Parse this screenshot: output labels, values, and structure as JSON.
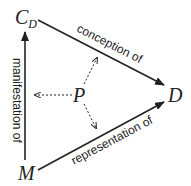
{
  "nodes": {
    "cd": {
      "label": "C",
      "subscript": "D"
    },
    "d": {
      "label": "D"
    },
    "m": {
      "label": "M"
    },
    "p": {
      "label": "P"
    }
  },
  "edges": {
    "cd_to_d": "conception of",
    "m_to_d": "representation of",
    "m_to_cd": "manifestation of"
  },
  "colors": {
    "line": "#222222"
  }
}
